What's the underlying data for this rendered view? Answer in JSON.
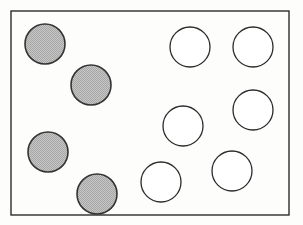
{
  "figure": {
    "title": "Two groups of circles inside a rectangular frame",
    "width": 303,
    "height": 225,
    "background_color": "#fdfdfc"
  },
  "frame": {
    "label": "rectangular border",
    "x": 11,
    "y": 11,
    "width": 278,
    "height": 204,
    "stroke_color": "#ララ",
    "stroke": "#2b2b2b",
    "stroke_width": 1.4,
    "fill": "none"
  },
  "chart_data": {
    "type": "scatter",
    "title": "Two groups of circles inside a rectangular frame",
    "xlabel": "",
    "ylabel": "",
    "xlim": [
      11,
      289
    ],
    "ylim": [
      11,
      215
    ],
    "grid": false,
    "legend": "none",
    "counts": {
      "shaded": 4,
      "unshaded": 6,
      "total": 10
    },
    "series": [
      {
        "name": "shaded",
        "marker": "circle",
        "fill": "#b9b9b9",
        "stroke": "#333333",
        "points": [
          {
            "label": "shaded-1",
            "cx": 45,
            "cy": 44,
            "r": 20
          },
          {
            "label": "shaded-2",
            "cx": 91,
            "cy": 85,
            "r": 20
          },
          {
            "label": "shaded-3",
            "cx": 48,
            "cy": 152,
            "r": 20
          },
          {
            "label": "shaded-4",
            "cx": 97,
            "cy": 194,
            "r": 20
          }
        ]
      },
      {
        "name": "unshaded",
        "marker": "circle",
        "fill": "#ffffff",
        "stroke": "#2b2b2b",
        "points": [
          {
            "label": "unshaded-1",
            "cx": 190,
            "cy": 47,
            "r": 20
          },
          {
            "label": "unshaded-2",
            "cx": 253,
            "cy": 47,
            "r": 20
          },
          {
            "label": "unshaded-3",
            "cx": 253,
            "cy": 110,
            "r": 20
          },
          {
            "label": "unshaded-4",
            "cx": 183,
            "cy": 126,
            "r": 20
          },
          {
            "label": "unshaded-5",
            "cx": 161,
            "cy": 182,
            "r": 20
          },
          {
            "label": "unshaded-6",
            "cx": 232,
            "cy": 171,
            "r": 20
          }
        ]
      }
    ]
  }
}
